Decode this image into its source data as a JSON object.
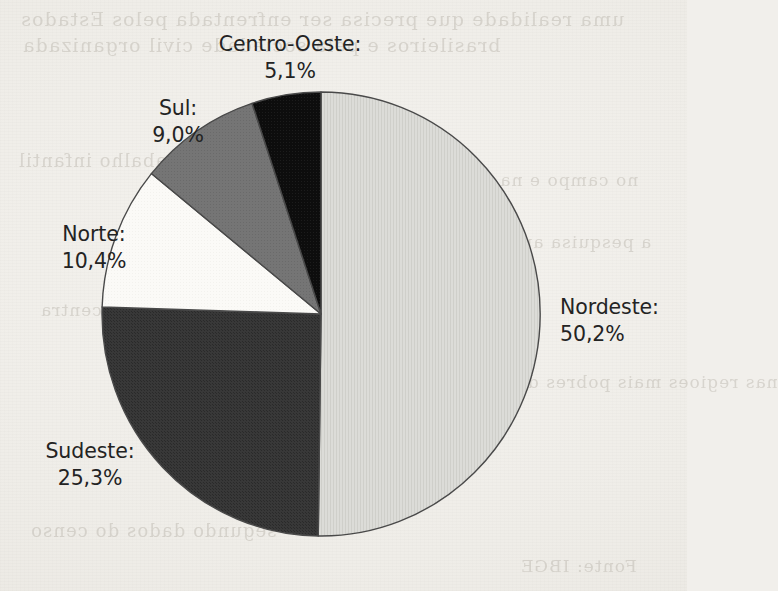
{
  "document": {
    "kind": "scanned-book-page",
    "background_color": "#f1efeb",
    "ghost_text": [
      {
        "text": "uma realidade que precisa ser enfrentada pelos Estados",
        "x": 20,
        "y": 8,
        "size": 19
      },
      {
        "text": "brasileiros e pela sociedade civil organizada",
        "x": 22,
        "y": 34,
        "size": 19
      },
      {
        "text": "trabalho infantil",
        "x": 18,
        "y": 150,
        "size": 18
      },
      {
        "text": "no campo e na cidade",
        "x": 430,
        "y": 170,
        "size": 17
      },
      {
        "text": "a pesquisa aponta que a maior parte",
        "x": 300,
        "y": 232,
        "size": 17
      },
      {
        "text": "dos casos se concentra",
        "x": 40,
        "y": 300,
        "size": 17
      },
      {
        "text": "nas regioes mais pobres do pais",
        "x": 470,
        "y": 372,
        "size": 17
      },
      {
        "text": "segundo dados do censo",
        "x": 30,
        "y": 520,
        "size": 18
      },
      {
        "text": "Fonte: IBGE",
        "x": 520,
        "y": 556,
        "size": 17
      }
    ]
  },
  "chart_data": {
    "type": "pie",
    "title": "",
    "subtitle": "",
    "xlabel": "",
    "ylabel": "",
    "legend_position": "outside-labels",
    "grid": false,
    "label_format": "{name}:\n{value}%",
    "decimal_separator": ",",
    "start_angle_deg": 0,
    "direction": "clockwise",
    "categories": [
      "Nordeste",
      "Sudeste",
      "Norte",
      "Sul",
      "Centro-Oeste"
    ],
    "values": [
      50.2,
      25.3,
      10.4,
      9.0,
      5.1
    ],
    "value_labels": [
      "50,2%",
      "25,3%",
      "10,4%",
      "9,0%",
      "5,1%"
    ],
    "colors": [
      "#d6d6d2",
      "#343434",
      "#fbfaf7",
      "#727272",
      "#0e0e0e"
    ],
    "slices": [
      {
        "name": "Nordeste",
        "label": "Nordeste:",
        "value": 50.2,
        "value_label": "50,2%",
        "color": "#d6d6d2",
        "start_deg": 0,
        "end_deg": 180.72,
        "label_align": "left"
      },
      {
        "name": "Sudeste",
        "label": "Sudeste:",
        "value": 25.3,
        "value_label": "25,3%",
        "color": "#343434",
        "start_deg": 180.72,
        "end_deg": 271.8,
        "label_align": "center"
      },
      {
        "name": "Norte",
        "label": "Norte:",
        "value": 10.4,
        "value_label": "10,4%",
        "color": "#fbfaf7",
        "start_deg": 271.8,
        "end_deg": 309.24,
        "label_align": "center"
      },
      {
        "name": "Sul",
        "label": "Sul:",
        "value": 9.0,
        "value_label": "9,0%",
        "color": "#727272",
        "start_deg": 309.24,
        "end_deg": 341.64,
        "label_align": "center"
      },
      {
        "name": "Centro-Oeste",
        "label": "Centro-Oeste:",
        "value": 5.1,
        "value_label": "5,1%",
        "color": "#0e0e0e",
        "start_deg": 341.64,
        "end_deg": 360,
        "label_align": "center"
      }
    ],
    "geometry": {
      "center_x": 321,
      "center_y": 314,
      "radius_x": 219,
      "radius_y": 222,
      "outline_color": "#4a4a4a",
      "outline_width": 1.4
    }
  }
}
